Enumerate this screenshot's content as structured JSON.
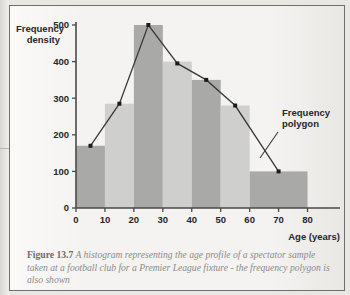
{
  "figure": {
    "label": "Figure 13.7",
    "caption": "A histogram representing the age profile of a spectator sample taken at a football club for a Premier League fixture - the frequency polygon is also shown"
  },
  "annotations": {
    "polygon_label_line1": "Frequency",
    "polygon_label_line2": "polygon"
  },
  "axis": {
    "y_title_line1": "Frequency",
    "y_title_line2": "density",
    "x_title": "Age (years)"
  },
  "chart_data": {
    "type": "bar",
    "title": "",
    "xlabel": "Age (years)",
    "ylabel": "Frequency density",
    "xlim": [
      0,
      85
    ],
    "ylim": [
      0,
      500
    ],
    "grid": false,
    "legend": false,
    "y_ticks": [
      0,
      100,
      200,
      300,
      400,
      500
    ],
    "x_ticks": [
      0,
      10,
      20,
      30,
      40,
      50,
      60,
      70,
      80
    ],
    "bins": [
      {
        "start": 0,
        "end": 10,
        "value": 170,
        "shade": "dark"
      },
      {
        "start": 10,
        "end": 20,
        "value": 285,
        "shade": "light"
      },
      {
        "start": 20,
        "end": 30,
        "value": 500,
        "shade": "dark"
      },
      {
        "start": 30,
        "end": 40,
        "value": 400,
        "shade": "light"
      },
      {
        "start": 40,
        "end": 50,
        "value": 350,
        "shade": "dark"
      },
      {
        "start": 50,
        "end": 60,
        "value": 280,
        "shade": "light"
      },
      {
        "start": 60,
        "end": 80,
        "value": 100,
        "shade": "dark"
      }
    ],
    "polygon": {
      "name": "Frequency polygon",
      "x": [
        5,
        15,
        25,
        35,
        45,
        55,
        70
      ],
      "y": [
        170,
        285,
        500,
        395,
        350,
        280,
        100
      ]
    },
    "colors": {
      "bar_dark": "#a9a9a7",
      "bar_light": "#cfcfcd",
      "line": "#3a3a38",
      "axis": "#4a4a48"
    }
  }
}
